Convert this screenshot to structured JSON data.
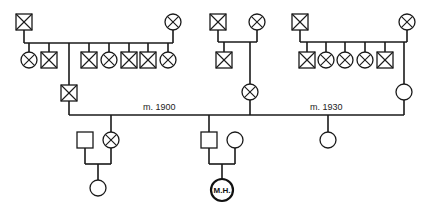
{
  "diagram": {
    "type": "pedigree",
    "marriages": [
      {
        "label": "m. 1900"
      },
      {
        "label": "m. 1930"
      }
    ],
    "proband": {
      "label": "M.H.",
      "sex": "female"
    },
    "legend_hint": {
      "crossed_square": "deceased male",
      "crossed_circle": "deceased female",
      "open_square": "living male",
      "open_circle": "living female"
    },
    "generations": {
      "gen1": [
        {
          "id": "f1-father",
          "sex": "male",
          "deceased": true
        },
        {
          "id": "f1-mother",
          "sex": "female",
          "deceased": true
        },
        {
          "id": "f2-father",
          "sex": "male",
          "deceased": true
        },
        {
          "id": "f2-mother",
          "sex": "female",
          "deceased": true
        },
        {
          "id": "f3-father",
          "sex": "male",
          "deceased": true
        },
        {
          "id": "f3-mother",
          "sex": "female",
          "deceased": true
        }
      ],
      "gen2_family1": [
        "F",
        "M",
        "M",
        "F",
        "M",
        "M",
        "F"
      ],
      "gen2_family2": [
        "M",
        "F"
      ],
      "gen2_family3": [
        "M",
        "F",
        "F",
        "F",
        "M",
        "F"
      ],
      "gen3": [
        "F",
        "F",
        "F"
      ],
      "gen4": [
        "F",
        "F (proband)"
      ]
    }
  }
}
